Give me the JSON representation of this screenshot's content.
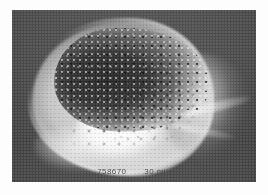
{
  "image": {
    "kind": "radiograph-photo",
    "modality_view": "lateral skull",
    "background_color": "#fdfdfd",
    "film_color": "#474747",
    "bone_color": "#f2f2f2",
    "lesion_color": "#1e1e1e"
  },
  "annotations": {
    "study_id": "758670",
    "time_label": "30 min"
  }
}
